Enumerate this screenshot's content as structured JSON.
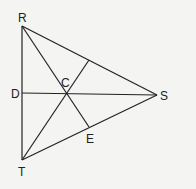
{
  "diagram": {
    "type": "triangle with medians meeting at centroid",
    "points": {
      "R": {
        "label": "R",
        "x": 22,
        "y": 26
      },
      "T": {
        "label": "T",
        "x": 22,
        "y": 160
      },
      "S": {
        "label": "S",
        "x": 157,
        "y": 95
      },
      "D": {
        "label": "D",
        "x": 22,
        "y": 93
      },
      "E": {
        "label": "E",
        "x": 89,
        "y": 127
      },
      "C": {
        "label": "C",
        "x": 68,
        "y": 93
      },
      "M": {
        "label": "",
        "x": 89,
        "y": 60
      }
    },
    "segments": [
      [
        "R",
        "S"
      ],
      [
        "S",
        "T"
      ],
      [
        "T",
        "R"
      ],
      [
        "R",
        "E"
      ],
      [
        "T",
        "M"
      ],
      [
        "D",
        "S"
      ]
    ],
    "stroke_color": "#222222",
    "background": "#f4f4f2"
  }
}
